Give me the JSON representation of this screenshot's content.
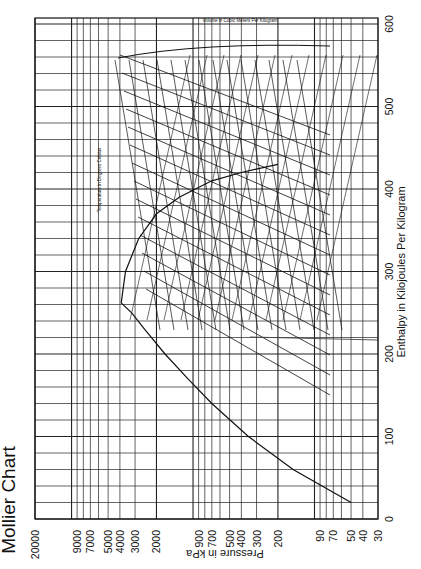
{
  "chart_data": {
    "type": "line",
    "title": "Mollier Chart",
    "orientation": "rotated-90-clockwise",
    "xlabel": "Pressure in kPa",
    "ylabel": "Enthalpy in Kilojoules Per Kilogram",
    "pressure_axis": {
      "scale": "log",
      "range": [
        30,
        20000
      ],
      "ticks": [
        20000,
        9000,
        7000,
        5000,
        4000,
        3000,
        2000,
        900,
        700,
        500,
        400,
        300,
        200,
        90,
        70,
        50,
        40,
        30
      ],
      "tick_labels": [
        "20000",
        "9000",
        "7000",
        "5000",
        "4000",
        "3000",
        "2000",
        "900",
        "700",
        "500",
        "400",
        "300",
        "200",
        "90",
        "70",
        "50",
        "40",
        "30"
      ]
    },
    "enthalpy_axis": {
      "scale": "linear",
      "range": [
        0,
        600
      ],
      "ticks": [
        0,
        100,
        200,
        300,
        400,
        500,
        600
      ],
      "tick_labels": [
        "0",
        "100",
        "200",
        "300",
        "400",
        "500",
        "600"
      ]
    },
    "grid": true,
    "annotations": {
      "temperature_label": "Temperature in Degrees Celsius",
      "volume_label": "Volume in Cubic Meters Per Kilogram",
      "entropy_label": "Entropy in kJ/kg·K"
    },
    "series": [
      {
        "name": "Saturated liquid line",
        "points_h_p": [
          [
            20,
            50
          ],
          [
            60,
            150
          ],
          [
            100,
            350
          ],
          [
            140,
            700
          ],
          [
            170,
            1100
          ],
          [
            200,
            1700
          ],
          [
            230,
            2500
          ],
          [
            250,
            3200
          ],
          [
            262,
            3900
          ]
        ]
      },
      {
        "name": "Saturated vapor line",
        "points_h_p": [
          [
            262,
            3900
          ],
          [
            300,
            3600
          ],
          [
            340,
            2800
          ],
          [
            370,
            2000
          ],
          [
            390,
            1300
          ],
          [
            410,
            700
          ],
          [
            420,
            400
          ],
          [
            430,
            200
          ]
        ]
      }
    ],
    "critical_point": {
      "h": 262,
      "p": 3900
    }
  }
}
